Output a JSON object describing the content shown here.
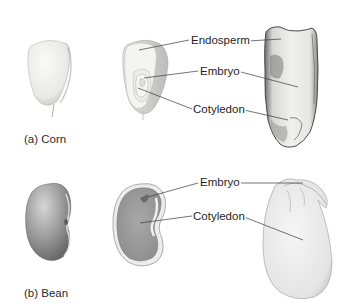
{
  "figure": {
    "panels": [
      {
        "id": "corn",
        "caption": "(a) Corn",
        "labels": {
          "endosperm": "Endosperm",
          "embryo": "Embryo",
          "cotyledon": "Cotyledon"
        },
        "views": [
          "whole-kernel",
          "cut-kernel",
          "side-view-kernel"
        ]
      },
      {
        "id": "bean",
        "caption": "(b) Bean",
        "labels": {
          "embryo": "Embryo",
          "cotyledon": "Cotyledon"
        },
        "views": [
          "whole-seed",
          "cut-seed",
          "open-half-seed"
        ]
      }
    ],
    "colors": {
      "background": "#ffffff",
      "leader_line": "#3a3a3a",
      "corn_fill": "#eeeeec",
      "bean_fill": "#9a9a9a",
      "text": "#1e1e1e"
    }
  }
}
